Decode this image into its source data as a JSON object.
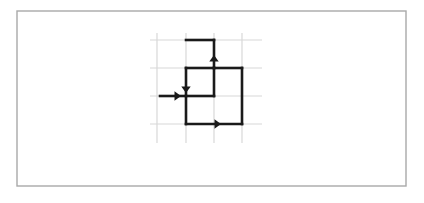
{
  "figure": {
    "canvas": {
      "width": 424,
      "height": 203,
      "background": "#ffffff"
    },
    "border": {
      "name": "outer-border",
      "x": 17,
      "y": 11,
      "width": 389,
      "height": 175,
      "stroke": "#a9a9a9",
      "stroke_width": 1.4,
      "fill": "none"
    },
    "grid": {
      "stroke": "#d8d8d8",
      "stroke_width": 1.2,
      "vertical_lines_x": [
        157,
        186,
        214,
        242
      ],
      "vertical_extent_y": [
        33,
        143
      ],
      "horizontal_lines_y": [
        40,
        68,
        96,
        124
      ],
      "horizontal_extent_x": [
        150,
        262
      ],
      "cell_size": 28
    },
    "path": {
      "stroke": "#1a1a1a",
      "stroke_width": 2.6,
      "fill": "none",
      "segments": [
        {
          "name": "entry-horizontal",
          "x1": 160,
          "y1": 96,
          "x2": 186,
          "y2": 96
        },
        {
          "name": "top-horizontal",
          "x1": 186,
          "y1": 40,
          "x2": 214,
          "y2": 40
        },
        {
          "name": "up-stem-vertical",
          "x1": 214,
          "y1": 40,
          "x2": 214,
          "y2": 68
        },
        {
          "name": "upper-right-horizontal",
          "x1": 214,
          "y1": 68,
          "x2": 242,
          "y2": 68
        },
        {
          "name": "inner-box-top",
          "x1": 186,
          "y1": 68,
          "x2": 214,
          "y2": 68
        },
        {
          "name": "inner-box-left",
          "x1": 186,
          "y1": 68,
          "x2": 186,
          "y2": 124
        },
        {
          "name": "inner-box-right",
          "x1": 214,
          "y1": 68,
          "x2": 214,
          "y2": 96
        },
        {
          "name": "inner-box-middle",
          "x1": 186,
          "y1": 96,
          "x2": 214,
          "y2": 96
        },
        {
          "name": "bottom-horizontal",
          "x1": 186,
          "y1": 124,
          "x2": 242,
          "y2": 124
        },
        {
          "name": "right-vertical",
          "x1": 242,
          "y1": 68,
          "x2": 242,
          "y2": 124
        }
      ]
    },
    "arrows": [
      {
        "name": "arrow-entry-right",
        "direction": "right",
        "tip_x": 181,
        "tip_y": 96,
        "size": 6.5,
        "color": "#1a1a1a"
      },
      {
        "name": "arrow-down",
        "direction": "down",
        "tip_x": 186,
        "tip_y": 93,
        "size": 6.5,
        "color": "#1a1a1a"
      },
      {
        "name": "arrow-up",
        "direction": "up",
        "tip_x": 214,
        "tip_y": 55,
        "size": 6.5,
        "color": "#1a1a1a"
      },
      {
        "name": "arrow-exit-right",
        "direction": "right",
        "tip_x": 221,
        "tip_y": 124,
        "size": 6.5,
        "color": "#1a1a1a"
      }
    ]
  }
}
